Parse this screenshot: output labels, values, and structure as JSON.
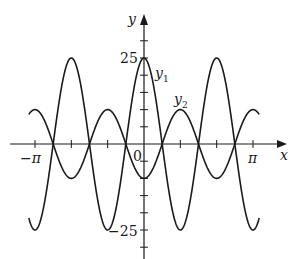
{
  "chart_data": {
    "type": "line",
    "title": "",
    "xlabel": "x",
    "ylabel": "y",
    "xlim": [
      -3.3,
      3.3
    ],
    "ylim": [
      -30,
      35
    ],
    "x_tick_labels": [
      "−π",
      "π"
    ],
    "x_tick_step": "π/3",
    "y_tick_labels": [
      "25",
      "−25"
    ],
    "y_tick_step": 5,
    "origin_label": "0",
    "grid": false,
    "series": [
      {
        "name": "y1",
        "label": "y",
        "sub": "1",
        "expr": "25cos(3x)",
        "amplitude": 25,
        "frequency": 3,
        "sign": 1,
        "x": [
          -3.1416,
          -2.0944,
          -1.0472,
          0,
          1.0472,
          2.0944,
          3.1416
        ],
        "values": [
          -25,
          25,
          -25,
          25,
          -25,
          25,
          -25
        ]
      },
      {
        "name": "y2",
        "label": "y",
        "sub": "2",
        "expr": "-10cos(3x)",
        "amplitude": 10,
        "frequency": 3,
        "sign": -1,
        "x": [
          -3.1416,
          -2.0944,
          -1.0472,
          0,
          1.0472,
          2.0944,
          3.1416
        ],
        "values": [
          10,
          -10,
          10,
          -10,
          10,
          -10,
          10
        ]
      }
    ]
  },
  "labels": {
    "y_axis": "y",
    "x_axis": "x",
    "y_top": "25",
    "y_bottom": "−25",
    "x_left": "−π",
    "x_right": "π",
    "origin": "0",
    "y1_main": "y",
    "y1_sub": "1",
    "y2_main": "y",
    "y2_sub": "2"
  }
}
